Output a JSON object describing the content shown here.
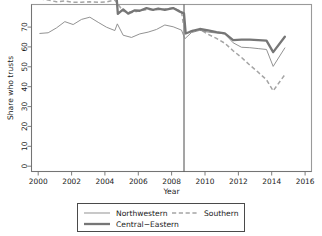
{
  "chart_data": {
    "type": "line",
    "title": "",
    "xlabel": "Year",
    "ylabel": "Share who trusts",
    "xlim": [
      1999.6,
      2016.4
    ],
    "ylim": [
      0,
      75
    ],
    "xticks": [
      2000,
      2002,
      2004,
      2006,
      2008,
      2010,
      2012,
      2014,
      2016
    ],
    "yticks": [
      0,
      10,
      20,
      30,
      40,
      50,
      60,
      70
    ],
    "grid": false,
    "legend_position": "bottom",
    "annotations": [
      {
        "type": "vline",
        "x": 2008.75,
        "label": ""
      }
    ],
    "series": [
      {
        "name": "Northwestern",
        "style": "solid-thin",
        "color": "#8c8c8c",
        "x": [
          2000.1,
          2000.6,
          2001.1,
          2001.6,
          2002.1,
          2002.6,
          2003.1,
          2003.6,
          2004.1,
          2004.6,
          2004.75,
          2005.1,
          2005.6,
          2006.1,
          2006.6,
          2007.1,
          2007.6,
          2008.1,
          2008.6,
          2008.8,
          2009.2,
          2009.7,
          2010.2,
          2010.7,
          2011.2,
          2011.7,
          2012.2,
          2012.7,
          2013.2,
          2013.7,
          2014.1,
          2014.8
        ],
        "y": [
          62.0,
          62.3,
          64.5,
          67.3,
          66.0,
          68.3,
          69.3,
          67.0,
          64.8,
          63.3,
          66.3,
          61.2,
          60.2,
          61.8,
          62.6,
          63.8,
          65.8,
          65.0,
          63.5,
          59.6,
          62.4,
          63.4,
          62.6,
          62.2,
          61.8,
          57.8,
          55.8,
          55.6,
          55.2,
          54.8,
          47.2,
          55.5
        ]
      },
      {
        "name": "Southern",
        "style": "dashed",
        "color": "#a5a5a5",
        "x": [
          2000.1,
          2000.6,
          2001.1,
          2001.6,
          2002.1,
          2002.6,
          2003.1,
          2003.6,
          2004.1,
          2004.6,
          2005.1,
          2005.6,
          2006.1,
          2006.6,
          2007.1,
          2007.6,
          2008.1,
          2008.6,
          2008.8,
          2009.2,
          2009.7,
          2010.2,
          2010.7,
          2011.2,
          2011.7,
          2012.2,
          2012.7,
          2013.2,
          2013.7,
          2014.1,
          2014.8
        ],
        "y": [
          77.5,
          77.0,
          76.2,
          76.6,
          76.0,
          76.0,
          76.2,
          76.0,
          76.2,
          77.0,
          72.0,
          71.4,
          72.2,
          72.8,
          72.6,
          73.0,
          73.4,
          71.8,
          61.8,
          63.2,
          63.8,
          61.6,
          59.8,
          57.6,
          54.2,
          51.2,
          47.8,
          44.6,
          41.2,
          36.2,
          43.5
        ]
      },
      {
        "name": "Central-Eastern",
        "style": "solid-thick",
        "color": "#767676",
        "x": [
          2004.72,
          2004.78,
          2005.1,
          2005.4,
          2005.8,
          2006.1,
          2006.5,
          2006.9,
          2007.2,
          2007.6,
          2008.1,
          2008.5,
          2008.75,
          2008.85,
          2009.2,
          2009.7,
          2010.2,
          2010.7,
          2011.2,
          2011.7,
          2012.2,
          2012.7,
          2013.2,
          2013.7,
          2014.1,
          2014.8
        ],
        "y": [
          77.0,
          70.8,
          72.8,
          70.9,
          72.4,
          72.2,
          73.4,
          72.6,
          73.2,
          72.6,
          73.4,
          71.8,
          71.0,
          62.0,
          63.0,
          64.0,
          63.4,
          62.6,
          62.0,
          59.0,
          59.2,
          59.2,
          59.0,
          58.8,
          53.6,
          60.5
        ]
      }
    ],
    "legend_entries": [
      {
        "label": "Northwestern",
        "style": "solid-thin"
      },
      {
        "label": "Southern",
        "style": "dashed"
      },
      {
        "label": "Central−Eastern",
        "style": "solid-thick"
      }
    ]
  }
}
